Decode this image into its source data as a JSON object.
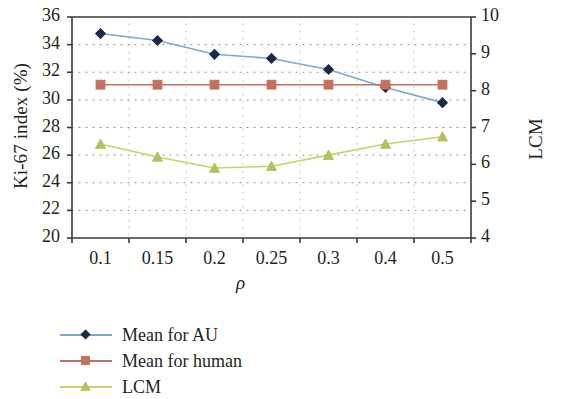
{
  "chart_data": {
    "type": "line",
    "title": "",
    "xlabel": "ρ",
    "ylabel": "Ki-67 index (%)",
    "y2label": "LCM",
    "categories": [
      "0.1",
      "0.15",
      "0.2",
      "0.25",
      "0.3",
      "0.4",
      "0.5"
    ],
    "ylim": [
      20,
      36
    ],
    "y2lim": [
      4,
      10
    ],
    "yticks": [
      "20",
      "22",
      "24",
      "26",
      "28",
      "30",
      "32",
      "34",
      "36"
    ],
    "y2ticks": [
      "4",
      "5",
      "6",
      "7",
      "8",
      "9",
      "10"
    ],
    "grid": "dotted-both",
    "legend_position": "below-left",
    "series": [
      {
        "name": "Mean for AU",
        "axis": "left",
        "color": "#7fa8d0",
        "marker": "diamond",
        "marker_color": "#1b2a4a",
        "values": [
          34.8,
          34.3,
          33.3,
          33.0,
          32.2,
          30.9,
          29.8
        ]
      },
      {
        "name": "Mean for human",
        "axis": "left",
        "color": "#c4705c",
        "marker": "square",
        "marker_color": "#c4705c",
        "values": [
          31.1,
          31.1,
          31.1,
          31.1,
          31.1,
          31.1,
          31.1
        ]
      },
      {
        "name": "LCM",
        "axis": "right",
        "color": "#c2d46a",
        "marker": "triangle",
        "marker_color": "#aec45e",
        "values": [
          6.55,
          6.2,
          5.9,
          5.95,
          6.25,
          6.55,
          6.75
        ]
      }
    ]
  },
  "axes": {
    "left_ticks": [
      "36",
      "34",
      "32",
      "30",
      "28",
      "26",
      "24",
      "22",
      "20"
    ],
    "right_ticks": [
      "10",
      "9",
      "8",
      "7",
      "6",
      "5",
      "4"
    ],
    "x_ticks": [
      "0.1",
      "0.15",
      "0.2",
      "0.25",
      "0.3",
      "0.4",
      "0.5"
    ],
    "left_title": "Ki-67 index (%)",
    "right_title": "LCM",
    "x_title": "ρ"
  },
  "legend": {
    "items": [
      {
        "label": "Mean for AU",
        "color": "#7fa8d0",
        "marker_color": "#1b2a4a",
        "marker": "diamond"
      },
      {
        "label": "Mean for human",
        "color": "#c4705c",
        "marker_color": "#c4705c",
        "marker": "square"
      },
      {
        "label": "LCM",
        "color": "#c2d46a",
        "marker_color": "#aec45e",
        "marker": "triangle"
      }
    ]
  }
}
